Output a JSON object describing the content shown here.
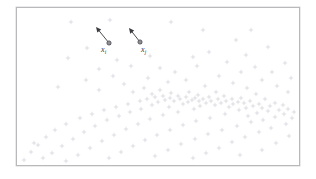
{
  "figure": {
    "background_color": "#ffffff",
    "frame": {
      "border_color": "#b9b9bc",
      "fill_color": "#ffffff",
      "x": 16,
      "y": 7,
      "width": 284,
      "height": 159
    }
  },
  "annotations": {
    "arrow_color": "#3a3a3f",
    "marker_fill": "#8f8f95",
    "marker_stroke": "#4a4a50",
    "items": [
      {
        "id": "xi",
        "label_main": "x",
        "label_sub": "i",
        "point": {
          "x": 109,
          "y": 43
        },
        "arrow_tip": {
          "x": 96,
          "y": 27
        },
        "label_pos": {
          "x": 101,
          "y": 46
        }
      },
      {
        "id": "xj",
        "label_main": "x",
        "label_sub": "j",
        "point": {
          "x": 140,
          "y": 42
        },
        "arrow_tip": {
          "x": 129,
          "y": 28
        },
        "label_pos": {
          "x": 141,
          "y": 46
        }
      }
    ]
  },
  "chart_data": {
    "type": "scatter",
    "title": "",
    "xlabel": "",
    "ylabel": "",
    "xlim": [
      16,
      300
    ],
    "ylim": [
      7,
      166
    ],
    "grid": false,
    "legend": null,
    "marker": {
      "shape": "plus",
      "size": 2.2,
      "color": "#cfcfd4",
      "stroke_width": 0.6
    },
    "annotated_points": [
      {
        "name": "x_i",
        "x": 109,
        "y": 43
      },
      {
        "name": "x_j",
        "x": 140,
        "y": 42
      }
    ],
    "points": [
      [
        71,
        22
      ],
      [
        110,
        20
      ],
      [
        171,
        22
      ],
      [
        203,
        30
      ],
      [
        109,
        43
      ],
      [
        140,
        42
      ],
      [
        251,
        30
      ],
      [
        236,
        40
      ],
      [
        87,
        48
      ],
      [
        150,
        56
      ],
      [
        117,
        60
      ],
      [
        193,
        57
      ],
      [
        68,
        58
      ],
      [
        246,
        55
      ],
      [
        268,
        47
      ],
      [
        227,
        62
      ],
      [
        160,
        68
      ],
      [
        131,
        66
      ],
      [
        99,
        69
      ],
      [
        209,
        52
      ],
      [
        285,
        63
      ],
      [
        175,
        72
      ],
      [
        255,
        67
      ],
      [
        241,
        72
      ],
      [
        113,
        76
      ],
      [
        197,
        66
      ],
      [
        272,
        72
      ],
      [
        148,
        78
      ],
      [
        219,
        76
      ],
      [
        86,
        80
      ],
      [
        168,
        82
      ],
      [
        233,
        83
      ],
      [
        262,
        80
      ],
      [
        291,
        78
      ],
      [
        124,
        84
      ],
      [
        186,
        80
      ],
      [
        205,
        86
      ],
      [
        247,
        88
      ],
      [
        58,
        87
      ],
      [
        144,
        88
      ],
      [
        99,
        90
      ],
      [
        277,
        86
      ],
      [
        160,
        90
      ],
      [
        216,
        92
      ],
      [
        189,
        92
      ],
      [
        133,
        92
      ],
      [
        171,
        93
      ],
      [
        256,
        94
      ],
      [
        224,
        96
      ],
      [
        288,
        92
      ],
      [
        152,
        94
      ],
      [
        198,
        95
      ],
      [
        241,
        98
      ],
      [
        178,
        96
      ],
      [
        209,
        97
      ],
      [
        265,
        99
      ],
      [
        163,
        96
      ],
      [
        186,
        97
      ],
      [
        232,
        99
      ],
      [
        275,
        103
      ],
      [
        155,
        97
      ],
      [
        195,
        98
      ],
      [
        218,
        99
      ],
      [
        250,
        101
      ],
      [
        170,
        98
      ],
      [
        203,
        99
      ],
      [
        238,
        102
      ],
      [
        283,
        105
      ],
      [
        147,
        99
      ],
      [
        180,
        99
      ],
      [
        226,
        101
      ],
      [
        259,
        104
      ],
      [
        192,
        100
      ],
      [
        211,
        101
      ],
      [
        244,
        103
      ],
      [
        270,
        106
      ],
      [
        165,
        100
      ],
      [
        199,
        101
      ],
      [
        233,
        104
      ],
      [
        288,
        109
      ],
      [
        140,
        101
      ],
      [
        174,
        101
      ],
      [
        221,
        103
      ],
      [
        253,
        106
      ],
      [
        188,
        102
      ],
      [
        206,
        103
      ],
      [
        262,
        108
      ],
      [
        279,
        110
      ],
      [
        158,
        102
      ],
      [
        215,
        105
      ],
      [
        246,
        108
      ],
      [
        294,
        112
      ],
      [
        128,
        104
      ],
      [
        183,
        104
      ],
      [
        229,
        107
      ],
      [
        268,
        111
      ],
      [
        152,
        105
      ],
      [
        200,
        106
      ],
      [
        239,
        110
      ],
      [
        284,
        114
      ],
      [
        116,
        107
      ],
      [
        169,
        107
      ],
      [
        257,
        113
      ],
      [
        292,
        118
      ],
      [
        104,
        110
      ],
      [
        141,
        109
      ],
      [
        194,
        109
      ],
      [
        248,
        116
      ],
      [
        275,
        117
      ],
      [
        92,
        114
      ],
      [
        130,
        112
      ],
      [
        178,
        112
      ],
      [
        225,
        114
      ],
      [
        263,
        120
      ],
      [
        80,
        118
      ],
      [
        119,
        116
      ],
      [
        163,
        115
      ],
      [
        210,
        118
      ],
      [
        251,
        122
      ],
      [
        286,
        124
      ],
      [
        66,
        124
      ],
      [
        107,
        120
      ],
      [
        150,
        119
      ],
      [
        196,
        121
      ],
      [
        237,
        126
      ],
      [
        271,
        128
      ],
      [
        55,
        130
      ],
      [
        95,
        126
      ],
      [
        138,
        124
      ],
      [
        183,
        125
      ],
      [
        222,
        130
      ],
      [
        259,
        132
      ],
      [
        46,
        137
      ],
      [
        84,
        132
      ],
      [
        126,
        129
      ],
      [
        170,
        130
      ],
      [
        208,
        134
      ],
      [
        245,
        137
      ],
      [
        38,
        145
      ],
      [
        73,
        139
      ],
      [
        114,
        135
      ],
      [
        157,
        135
      ],
      [
        195,
        139
      ],
      [
        232,
        142
      ],
      [
        31,
        152
      ],
      [
        62,
        146
      ],
      [
        102,
        141
      ],
      [
        145,
        140
      ],
      [
        181,
        144
      ],
      [
        219,
        148
      ],
      [
        52,
        153
      ],
      [
        90,
        148
      ],
      [
        133,
        146
      ],
      [
        168,
        150
      ],
      [
        206,
        153
      ],
      [
        276,
        143
      ],
      [
        43,
        158
      ],
      [
        78,
        155
      ],
      [
        121,
        152
      ],
      [
        155,
        156
      ],
      [
        193,
        158
      ],
      [
        289,
        136
      ],
      [
        24,
        160
      ],
      [
        66,
        161
      ],
      [
        109,
        158
      ],
      [
        34,
        143
      ],
      [
        240,
        155
      ],
      [
        262,
        150
      ]
    ]
  }
}
